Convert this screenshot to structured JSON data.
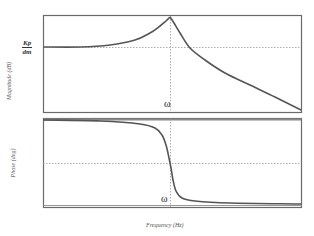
{
  "chart_data": [
    {
      "type": "line",
      "title": "",
      "xlabel": "",
      "ylabel": "Magnitude (dB)",
      "y_marker_label": {
        "numerator": "Kp",
        "denominator": "dm"
      },
      "x_marker_label": "ω",
      "grid": false,
      "reference_lines": {
        "horizontal": "Kp/dm level (dotted)",
        "vertical": "ω (dotted)"
      },
      "series": [
        {
          "name": "Magnitude",
          "points_px": [
            [
              43,
              47
            ],
            [
              80,
              47
            ],
            [
              110,
              45
            ],
            [
              135,
              40
            ],
            [
              150,
              33
            ],
            [
              160,
              26
            ],
            [
              166,
              21
            ],
            [
              170,
              17
            ],
            [
              174,
              23
            ],
            [
              180,
              33
            ],
            [
              190,
              48
            ],
            [
              205,
              60
            ],
            [
              225,
              73
            ],
            [
              250,
              85
            ],
            [
              275,
              97
            ],
            [
              301,
              110
            ]
          ]
        }
      ],
      "description": "Flat at Kp/dm at low frequency, resonant peak at ω, then roll-off"
    },
    {
      "type": "line",
      "title": "",
      "xlabel": "Frequency (Hz)",
      "ylabel": "Phase (deg)",
      "x_marker_label": "ω",
      "grid": false,
      "reference_lines": {
        "horizontal": "mid phase (dotted)",
        "vertical": "ω (dotted)"
      },
      "series": [
        {
          "name": "Phase",
          "points_px": [
            [
              43,
              120
            ],
            [
              100,
              121
            ],
            [
              140,
              124
            ],
            [
              155,
              128
            ],
            [
              162,
              135
            ],
            [
              166,
              145
            ],
            [
              169,
              158
            ],
            [
              171,
              168
            ],
            [
              173,
              180
            ],
            [
              176,
              191
            ],
            [
              182,
              198
            ],
            [
              195,
              201
            ],
            [
              230,
              203
            ],
            [
              301,
              204
            ]
          ]
        }
      ],
      "description": "Phase flat at top, sharp transition through midline at ω, then flat at bottom"
    }
  ],
  "labels": {
    "mag_ylabel": "Magnitude (dB)",
    "phase_ylabel": "Phase (deg)",
    "xlabel": "Frequency (Hz)",
    "kp_num": "Kp",
    "kp_den": "dm",
    "omega_top": "ω",
    "omega_bottom": "ω"
  },
  "colors": {
    "frame": "#6a6a6a",
    "curve": "#555555",
    "dotted": "#999999"
  }
}
